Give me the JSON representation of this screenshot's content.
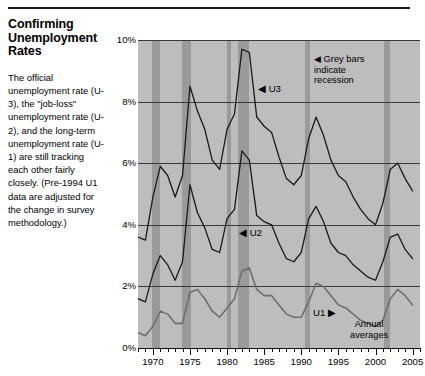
{
  "sidebar": {
    "title": "Confirming Unemployment Rates",
    "body": "The official unemployment rate (U-3), the \"job-loss\" unemployment rate (U-2), and the long-term unemployment rate (U-1) are still tracking each other fairly closely. (Pre-1994 U1 data are adjusted for the change in survey methodology.)"
  },
  "annotations": {
    "u3": "◀ U3",
    "u2": "◀ U2",
    "u1": "U1 ▶",
    "recession_note": "◀ Grey bars\nindicate\nrecession",
    "annual_note": "Annual\naverages"
  },
  "colors": {
    "plot_background": "#bdbdbd",
    "recession_band": "#9a9a9a",
    "u3_line": "#1a1a1a",
    "u2_line": "#1a1a1a",
    "u1_line": "#6f6f6f",
    "gridline": "#3a3a3a",
    "axis": "#111111"
  },
  "chart_data": {
    "type": "line",
    "title": "Confirming Unemployment Rates",
    "xlabel": "",
    "ylabel": "",
    "xlim": [
      1968,
      2006
    ],
    "ylim": [
      0,
      10
    ],
    "yticks": [
      0,
      2,
      4,
      6,
      8,
      10
    ],
    "ytick_labels": [
      "0%",
      "2%",
      "4%",
      "6%",
      "8%",
      "10%"
    ],
    "xticks": [
      1970,
      1975,
      1980,
      1985,
      1990,
      1995,
      2000,
      2005
    ],
    "xtick_labels": [
      "1970",
      "1975",
      "1980",
      "1985",
      "1990",
      "1995",
      "2000",
      "2005"
    ],
    "minor_xtick_interval": 1,
    "grid": true,
    "legend": "inline-labels",
    "units": "percent",
    "note": "Annual averages",
    "recession_bands": [
      {
        "start": 1969.9,
        "end": 1970.9
      },
      {
        "start": 1973.9,
        "end": 1975.2
      },
      {
        "start": 1980.0,
        "end": 1980.6
      },
      {
        "start": 1981.5,
        "end": 1982.9
      },
      {
        "start": 1990.5,
        "end": 1991.2
      },
      {
        "start": 2001.2,
        "end": 2001.9
      }
    ],
    "x": [
      1968,
      1969,
      1970,
      1971,
      1972,
      1973,
      1974,
      1975,
      1976,
      1977,
      1978,
      1979,
      1980,
      1981,
      1982,
      1983,
      1984,
      1985,
      1986,
      1987,
      1988,
      1989,
      1990,
      1991,
      1992,
      1993,
      1994,
      1995,
      1996,
      1997,
      1998,
      1999,
      2000,
      2001,
      2002,
      2003,
      2004,
      2005
    ],
    "series": [
      {
        "name": "U3",
        "label": "U3",
        "color": "#1a1a1a",
        "values": [
          3.6,
          3.5,
          4.9,
          5.9,
          5.6,
          4.9,
          5.6,
          8.5,
          7.7,
          7.1,
          6.1,
          5.8,
          7.1,
          7.6,
          9.7,
          9.6,
          7.5,
          7.2,
          7.0,
          6.2,
          5.5,
          5.3,
          5.6,
          6.8,
          7.5,
          6.9,
          6.1,
          5.6,
          5.4,
          4.9,
          4.5,
          4.2,
          4.0,
          4.7,
          5.8,
          6.0,
          5.5,
          5.1
        ]
      },
      {
        "name": "U2",
        "label": "U2",
        "color": "#1a1a1a",
        "values": [
          1.6,
          1.5,
          2.4,
          3.0,
          2.7,
          2.2,
          2.8,
          5.3,
          4.4,
          3.9,
          3.2,
          3.1,
          4.2,
          4.5,
          6.4,
          6.1,
          4.3,
          4.1,
          4.0,
          3.4,
          2.9,
          2.8,
          3.1,
          4.2,
          4.6,
          4.1,
          3.4,
          3.1,
          3.0,
          2.7,
          2.5,
          2.3,
          2.2,
          2.8,
          3.6,
          3.7,
          3.2,
          2.9
        ]
      },
      {
        "name": "U1",
        "label": "U1",
        "color": "#6f6f6f",
        "values": [
          0.5,
          0.4,
          0.7,
          1.2,
          1.1,
          0.8,
          0.8,
          1.8,
          1.9,
          1.6,
          1.2,
          1.0,
          1.3,
          1.6,
          2.5,
          2.6,
          1.9,
          1.7,
          1.7,
          1.4,
          1.1,
          1.0,
          1.0,
          1.5,
          2.1,
          2.0,
          1.7,
          1.4,
          1.3,
          1.1,
          0.9,
          0.8,
          0.7,
          0.9,
          1.6,
          1.9,
          1.7,
          1.4
        ]
      }
    ]
  }
}
